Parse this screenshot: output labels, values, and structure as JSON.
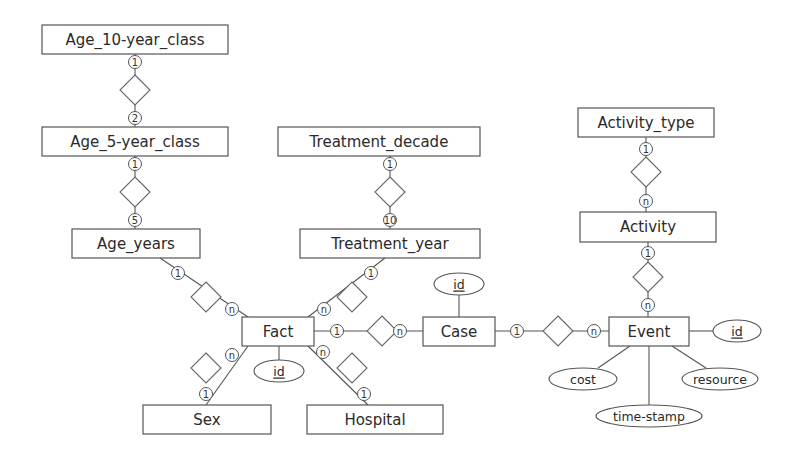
{
  "diagram": {
    "type": "entity-relationship",
    "entities": [
      {
        "id": "age10",
        "label": "Age_10-year_class"
      },
      {
        "id": "age5",
        "label": "Age_5-year_class"
      },
      {
        "id": "ageyears",
        "label": "Age_years"
      },
      {
        "id": "tdecade",
        "label": "Treatment_decade"
      },
      {
        "id": "tyear",
        "label": "Treatment_year"
      },
      {
        "id": "acttype",
        "label": "Activity_type"
      },
      {
        "id": "activity",
        "label": "Activity"
      },
      {
        "id": "fact",
        "label": "Fact"
      },
      {
        "id": "case",
        "label": "Case"
      },
      {
        "id": "event",
        "label": "Event"
      },
      {
        "id": "sex",
        "label": "Sex"
      },
      {
        "id": "hospital",
        "label": "Hospital"
      }
    ],
    "relationships": [
      {
        "from": "age10",
        "to": "age5",
        "card_from": "1",
        "card_to": "2"
      },
      {
        "from": "age5",
        "to": "ageyears",
        "card_from": "1",
        "card_to": "5"
      },
      {
        "from": "tdecade",
        "to": "tyear",
        "card_from": "1",
        "card_to": "10"
      },
      {
        "from": "acttype",
        "to": "activity",
        "card_from": "1",
        "card_to": "n"
      },
      {
        "from": "activity",
        "to": "event",
        "card_from": "1",
        "card_to": "n"
      },
      {
        "from": "ageyears",
        "to": "fact",
        "card_from": "1",
        "card_to": "n"
      },
      {
        "from": "tyear",
        "to": "fact",
        "card_from": "1",
        "card_to": "n"
      },
      {
        "from": "fact",
        "to": "case",
        "card_from": "1",
        "card_to": "n"
      },
      {
        "from": "case",
        "to": "event",
        "card_from": "1",
        "card_to": "n"
      },
      {
        "from": "sex",
        "to": "fact",
        "card_from": "1",
        "card_to": "n"
      },
      {
        "from": "hospital",
        "to": "fact",
        "card_from": "1",
        "card_to": "n"
      }
    ],
    "attributes": [
      {
        "entity": "fact",
        "label": "id",
        "key": true
      },
      {
        "entity": "case",
        "label": "id",
        "key": true
      },
      {
        "entity": "event",
        "label": "id",
        "key": true
      },
      {
        "entity": "event",
        "label": "cost",
        "key": false
      },
      {
        "entity": "event",
        "label": "time-stamp",
        "key": false
      },
      {
        "entity": "event",
        "label": "resource",
        "key": false
      }
    ],
    "colors": {
      "line": "#555555",
      "text": "#2a2a2a",
      "background": "#ffffff"
    }
  }
}
